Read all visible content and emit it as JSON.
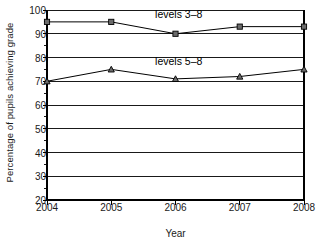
{
  "chart_data": {
    "type": "line",
    "title": "",
    "xlabel": "Year",
    "ylabel": "Percentage of pupils achieving grade",
    "categories": [
      "2004",
      "2005",
      "2006",
      "2007",
      "2008"
    ],
    "x": [
      2004,
      2005,
      2006,
      2007,
      2008
    ],
    "xlim": [
      2004,
      2008
    ],
    "ylim": [
      20,
      100
    ],
    "yticks": [
      20,
      30,
      40,
      50,
      60,
      70,
      80,
      90,
      100
    ],
    "ytick_labels": [
      "20",
      "30",
      "40",
      "50",
      "60",
      "70",
      "80",
      "90",
      "100"
    ],
    "grid": "horizontal",
    "legend_position": "inline-annotation",
    "series": [
      {
        "name": "levels 3–8",
        "marker": "square",
        "values": [
          95,
          95,
          90,
          93,
          93
        ],
        "annotation": "levels 3–8"
      },
      {
        "name": "levels 5–8",
        "marker": "triangle",
        "values": [
          70,
          75,
          71,
          72,
          75
        ],
        "annotation": "levels 5–8"
      }
    ],
    "annotations": [
      {
        "text": "levels 3–8",
        "x": 2006.05,
        "y": 96.5
      },
      {
        "text": "levels 5–8",
        "x": 2006.05,
        "y": 77.0
      }
    ],
    "colors": {
      "line": "#000000",
      "marker_face": "#6b6b6b",
      "marker_edge": "#000000",
      "grid": "#000000",
      "axis": "#000000",
      "background": "#ffffff",
      "text": "#1a1a1a"
    }
  }
}
